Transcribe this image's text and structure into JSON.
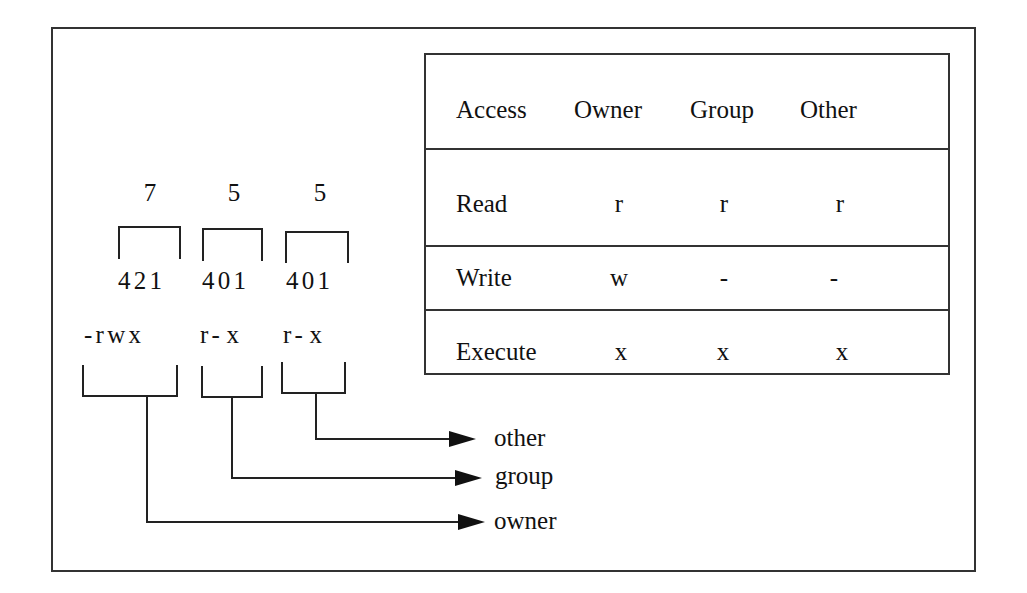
{
  "table": {
    "headers": [
      "Access",
      "Owner",
      "Group",
      "Other"
    ],
    "rows": [
      {
        "access": "Read",
        "owner": "r",
        "group": "r",
        "other": "r"
      },
      {
        "access": "Write",
        "owner": "w",
        "group": "-",
        "other": "-"
      },
      {
        "access": "Execute",
        "owner": "x",
        "group": "x",
        "other": "x"
      }
    ]
  },
  "octal": {
    "digits": [
      "7",
      "5",
      "5"
    ],
    "bit_weights": [
      "4 2 1",
      "4 0 1",
      "4 0 1"
    ],
    "symbolic_groups": [
      "- r w x",
      "r -  x",
      "r -  x"
    ]
  },
  "arrows": {
    "labels": [
      "other",
      "group",
      "owner"
    ]
  }
}
